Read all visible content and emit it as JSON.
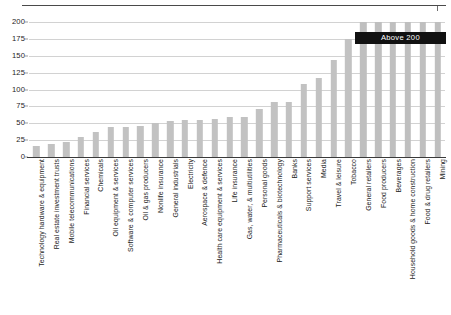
{
  "chart_data": {
    "type": "bar",
    "title": "",
    "xlabel": "",
    "ylabel": "",
    "ylim": [
      0,
      200
    ],
    "ytick_values": [
      0,
      25,
      50,
      75,
      100,
      125,
      150,
      175,
      200
    ],
    "ytick_labels": [
      "0",
      "25",
      "50",
      "75",
      "100",
      "125",
      "150",
      "175",
      "200"
    ],
    "grid": true,
    "legend": "none",
    "bar_color": "#c2c2c2",
    "annotation": {
      "text": "Above 200",
      "background": "#111111",
      "text_color": "#ffffff",
      "covers_categories": [
        "General retailers",
        "Food producers",
        "Beverages",
        "Household goods & home construction",
        "Food & drug retailers",
        "Mining"
      ]
    },
    "categories": [
      "Technology hardware & equipment",
      "Real estate investment trusts",
      "Mobile telecommunications",
      "Financial services",
      "Chemicals",
      "Oil equipment & services",
      "Software & computer services",
      "Oil & gas producers",
      "Nonlife insurance",
      "General industrials",
      "Electricity",
      "Aerospace & defence",
      "Health care equipment & services",
      "Life insurance",
      "Gas, water, & multiutilities",
      "Personal goods",
      "Pharmaceuticals & biotechnology",
      "Banks",
      "Support services",
      "Media",
      "Travel & leisure",
      "Tobacco",
      "General retailers",
      "Food producers",
      "Beverages",
      "Household goods & home construction",
      "Food & drug retailers",
      "Mining"
    ],
    "values": [
      17,
      19,
      22,
      30,
      37,
      44,
      45,
      46,
      50,
      54,
      55,
      55,
      56,
      60,
      60,
      71,
      81,
      82,
      108,
      117,
      143,
      175,
      200,
      200,
      200,
      200,
      200,
      200
    ],
    "value_notes": [
      "17",
      "19",
      "22",
      "30",
      "37",
      "44",
      "45",
      "46",
      "50",
      "54",
      "55",
      "55",
      "56",
      "60",
      "60",
      "71",
      "81",
      "82",
      "108",
      "117",
      "143",
      "175",
      "above 200",
      "above 200",
      "above 200",
      "above 200",
      "above 200",
      "above 200"
    ]
  }
}
